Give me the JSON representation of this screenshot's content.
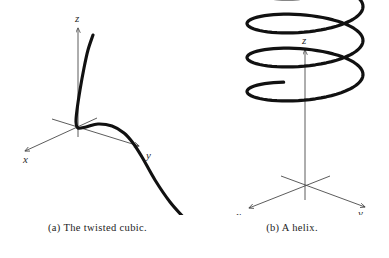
{
  "figure": {
    "background_color": "#ffffff",
    "curve_color": "#111111",
    "axis_color": "#4a4a4a",
    "subfigures": [
      {
        "id": "a",
        "caption": "(a) The twisted cubic.",
        "curve_name": "twisted-cubic",
        "axes": [
          {
            "name": "x",
            "label": "x",
            "label_x": 23,
            "label_y": 158
          },
          {
            "name": "y",
            "label": "y",
            "label_x": 146,
            "label_y": 155
          },
          {
            "name": "z",
            "label": "z",
            "label_y": 22,
            "label_x": 79
          }
        ]
      },
      {
        "id": "b",
        "caption": "(b) A helix.",
        "curve_name": "helix",
        "axes": [
          {
            "name": "x",
            "label": "x",
            "label_x": 41,
            "label_y": 215
          },
          {
            "name": "y",
            "label": "y",
            "label_x": 161,
            "label_y": 213
          },
          {
            "name": "z",
            "label": "z",
            "label_y": 44,
            "label_x": 110
          }
        ]
      }
    ]
  },
  "chart_data": {
    "type": "line",
    "title": "",
    "xlabel": "",
    "ylabel": "",
    "plots": [
      {
        "name": "twisted-cubic",
        "caption": "(a) The twisted cubic.",
        "parametrization": "r(t) = (t, t^2, t^3)",
        "axis_labels": [
          "x",
          "y",
          "z"
        ],
        "projection": "3d-oblique",
        "origin_px": [
          78,
          128
        ],
        "axis_endpoints_px": {
          "x": [
            22,
            152
          ],
          "y": [
            138,
            146
          ],
          "z": [
            78,
            28
          ]
        },
        "curve_points_px": [
          [
            93,
            35
          ],
          [
            88,
            50
          ],
          [
            84,
            68
          ],
          [
            80,
            90
          ],
          [
            77,
            110
          ],
          [
            76,
            122
          ],
          [
            78,
            128
          ],
          [
            86,
            127
          ],
          [
            98,
            124
          ],
          [
            112,
            126
          ],
          [
            124,
            133
          ],
          [
            133,
            143
          ],
          [
            142,
            157
          ],
          [
            155,
            180
          ],
          [
            170,
            202
          ],
          [
            185,
            219
          ]
        ],
        "description": "Steep nearly-straight branch descending from upper right into the origin, then a smooth bend to the right and a long descent to the lower right."
      },
      {
        "name": "helix",
        "caption": "(b) A helix.",
        "parametrization": "r(t) = (cos t, sin t, t)",
        "axis_labels": [
          "x",
          "y",
          "z"
        ],
        "projection": "3d-oblique",
        "turns": 4,
        "origin_px": [
          305,
          186
        ],
        "ellipse_center_x_px": 305,
        "ellipse_radius_x_px": 58,
        "ellipse_radius_y_px": 17,
        "turn_center_y_px": [
          78,
          112,
          146,
          180
        ],
        "axis_endpoints_px": {
          "x": [
            252,
            212
          ],
          "y": [
            362,
            209
          ],
          "z": [
            305,
            50
          ]
        },
        "description": "Circular helix of four turns, viewed obliquely so each turn draws a flat ellipse; the vertical z axis passes up through the centre and the x and y axes cross near the bottom turn."
      }
    ]
  }
}
